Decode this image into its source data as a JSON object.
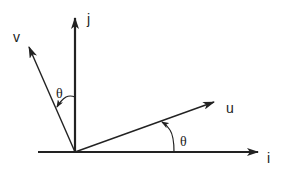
{
  "diagram": {
    "type": "vector-rotation",
    "colors": {
      "stroke": "#222222",
      "background": "#ffffff"
    },
    "axes": {
      "horizontal": {
        "label": "i"
      },
      "vertical": {
        "label": "j"
      }
    },
    "vectors": [
      {
        "id": "u",
        "label": "u"
      },
      {
        "id": "v",
        "label": "v"
      }
    ],
    "angles": [
      {
        "between": "i-u",
        "label": "θ"
      },
      {
        "between": "j-v",
        "label": "θ"
      }
    ]
  }
}
